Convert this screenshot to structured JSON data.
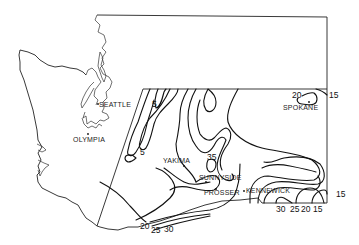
{
  "map": {
    "subject": "Washington State with contour map of eastern/central region",
    "colors": {
      "background": "#ffffff",
      "line": "#111111"
    },
    "cities": [
      {
        "id": "seattle",
        "name": "SEATTLE"
      },
      {
        "id": "olympia",
        "name": "OLYMPIA"
      },
      {
        "id": "yakima",
        "name": "YAKIMA"
      },
      {
        "id": "spokane",
        "name": "SPOKANE"
      },
      {
        "id": "sunnyside",
        "name": "SUNNYSIDE"
      },
      {
        "id": "prosser",
        "name": "PROSSER"
      },
      {
        "id": "kennewick",
        "name": "KENNEWICK"
      }
    ],
    "contour_labels": [
      {
        "id": "c5a",
        "value": "5"
      },
      {
        "id": "c5b",
        "value": "5"
      },
      {
        "id": "c35",
        "value": "35"
      },
      {
        "id": "c20ne",
        "value": "20"
      },
      {
        "id": "c15ne",
        "value": "15"
      },
      {
        "id": "c15e",
        "value": "15"
      },
      {
        "id": "c20sw",
        "value": "20"
      },
      {
        "id": "c25sw",
        "value": "25"
      },
      {
        "id": "c30sw",
        "value": "30"
      },
      {
        "id": "c30se",
        "value": "30"
      },
      {
        "id": "c25se",
        "value": "25"
      },
      {
        "id": "c20se",
        "value": "20"
      },
      {
        "id": "c15se",
        "value": "15"
      }
    ]
  }
}
